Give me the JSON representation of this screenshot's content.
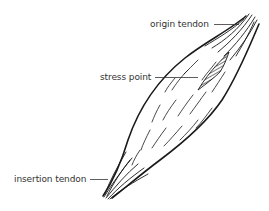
{
  "diagram": {
    "colors": {
      "ink": "#1a1a1a",
      "label": "#333333",
      "background": "#ffffff"
    },
    "labels": [
      {
        "id": "origin",
        "text": "origin tendon"
      },
      {
        "id": "stress",
        "text": "stress point"
      },
      {
        "id": "insertion",
        "text": "insertion tendon"
      }
    ]
  }
}
